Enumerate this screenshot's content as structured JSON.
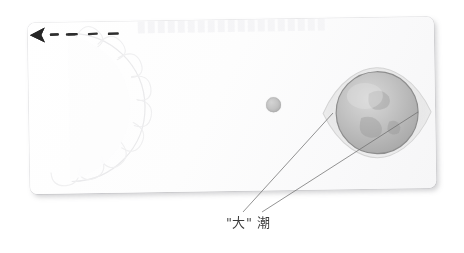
{
  "scene": {
    "title_ghost": "",
    "kind": "sun-moon-earth-spring-tide-diagram"
  },
  "card": {
    "name": "paper-card",
    "background_color": "#fdfdfd",
    "shadow_color": "#78787d"
  },
  "bodies": {
    "sun": {
      "label": "sun",
      "stroke_color": "#e2e2e4",
      "ray_count": 9
    },
    "moon": {
      "label": "moon",
      "fill_color": "#c3c3c3",
      "diameter_px": 15
    },
    "earth": {
      "label": "earth",
      "fill_color": "#b9b9b9",
      "bulge_color": "#dedede",
      "outline_color": "#8f8f8f"
    }
  },
  "arrows": {
    "long": {
      "name": "sun-direction-arrow",
      "direction": "left",
      "style": "dashed",
      "dash_count": 4,
      "color": "#2a2a2a"
    },
    "short": {
      "name": "moon-to-earth-arrow",
      "direction": "left",
      "style": "dashed",
      "dash_count": 2,
      "color": "#2a2a2a"
    }
  },
  "annotation": {
    "label_text": "\"大\"潮",
    "label_quote_open": "\"",
    "label_char_da": "大",
    "label_quote_close": "\"",
    "label_char_chao": "潮",
    "leader_line_color": "#6b6b6b",
    "leader_count": 2
  }
}
